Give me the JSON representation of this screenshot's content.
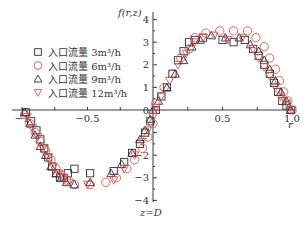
{
  "chart_data": {
    "type": "scatter",
    "title": "",
    "xlabel": "r",
    "ylabel": "f(r,z)",
    "annotation": "z=D",
    "xlim": [
      -1.0,
      1.0
    ],
    "ylim": [
      -4,
      4
    ],
    "x_ticks": [
      -1,
      -0.5,
      0,
      0.5,
      1.0
    ],
    "x_tick_labels": [
      "-1",
      "-0.5",
      "0",
      "0.5",
      "1.0"
    ],
    "y_ticks": [
      4,
      3,
      2,
      1,
      0,
      -2,
      -3,
      -4
    ],
    "y_tick_labels": [
      "4",
      "3",
      "2",
      "1",
      "0",
      "-2",
      "-3",
      "-4"
    ],
    "grid": false,
    "legend_position": "upper-left",
    "series": [
      {
        "name": "入口流量 3m³/h",
        "marker": "square",
        "color": "#2b2f3a",
        "x": [
          -0.97,
          -0.93,
          -0.89,
          -0.86,
          -0.83,
          -0.8,
          -0.77,
          -0.74,
          -0.71,
          -0.68,
          -0.65,
          -0.6,
          -0.48,
          -0.3,
          -0.22,
          -0.16,
          -0.1,
          -0.06,
          -0.02,
          0.02,
          0.06,
          0.1,
          0.14,
          0.18,
          0.22,
          0.26,
          0.3,
          0.36,
          0.5,
          0.58,
          0.66,
          0.72,
          0.76,
          0.8,
          0.84,
          0.87,
          0.9,
          0.93,
          0.96,
          0.99
        ],
        "y": [
          -0.1,
          -0.5,
          -0.9,
          -1.3,
          -1.7,
          -2.1,
          -2.5,
          -2.8,
          -3.0,
          -3.0,
          -2.8,
          -2.6,
          -2.8,
          -2.7,
          -2.3,
          -1.9,
          -1.5,
          -1.0,
          -0.5,
          0.0,
          0.6,
          1.0,
          1.6,
          2.2,
          2.6,
          3.0,
          3.1,
          3.2,
          3.1,
          3.0,
          3.1,
          2.7,
          2.4,
          2.0,
          1.6,
          1.2,
          0.8,
          0.4,
          0.2,
          0.0
        ]
      },
      {
        "name": "入口流量 6m³/h",
        "marker": "circle",
        "color": "#d9534f",
        "x": [
          -0.98,
          -0.94,
          -0.9,
          -0.86,
          -0.82,
          -0.78,
          -0.74,
          -0.7,
          -0.66,
          -0.6,
          -0.48,
          -0.36,
          -0.28,
          -0.2,
          -0.14,
          -0.08,
          -0.04,
          0.0,
          0.02,
          0.08,
          0.14,
          0.2,
          0.26,
          0.3,
          0.38,
          0.48,
          0.58,
          0.68,
          0.74,
          0.8,
          0.84,
          0.88,
          0.91,
          0.94,
          0.97,
          1.0
        ],
        "y": [
          -0.2,
          -0.6,
          -1.0,
          -1.4,
          -1.8,
          -2.2,
          -2.6,
          -2.9,
          -3.1,
          -3.3,
          -3.3,
          -3.2,
          -3.0,
          -2.6,
          -2.2,
          -1.7,
          -1.2,
          -0.6,
          0.3,
          1.0,
          1.6,
          2.3,
          2.7,
          3.2,
          3.4,
          3.5,
          3.5,
          3.5,
          3.2,
          2.8,
          2.3,
          1.8,
          1.3,
          0.8,
          0.4,
          0.0
        ]
      },
      {
        "name": "入口流量 9m³/h",
        "marker": "triangle-up",
        "color": "#2b2f3a",
        "x": [
          -0.98,
          -0.94,
          -0.9,
          -0.86,
          -0.82,
          -0.78,
          -0.74,
          -0.7,
          -0.66,
          -0.6,
          -0.48,
          -0.32,
          -0.24,
          -0.16,
          -0.1,
          -0.06,
          -0.02,
          0.0,
          0.04,
          0.1,
          0.16,
          0.22,
          0.28,
          0.34,
          0.42,
          0.52,
          0.62,
          0.7,
          0.76,
          0.8,
          0.84,
          0.88,
          0.92,
          0.96,
          0.99
        ],
        "y": [
          -0.1,
          -0.6,
          -1.1,
          -1.6,
          -2.0,
          -2.5,
          -2.8,
          -3.0,
          -3.2,
          -3.3,
          -3.2,
          -2.8,
          -2.4,
          -1.9,
          -1.3,
          -0.9,
          -0.4,
          0.0,
          0.4,
          1.0,
          1.6,
          2.2,
          2.8,
          3.1,
          3.3,
          3.2,
          3.2,
          2.9,
          2.6,
          2.2,
          1.8,
          1.3,
          0.8,
          0.4,
          0.0
        ]
      },
      {
        "name": "入口流量 12m³/h",
        "marker": "triangle-down",
        "color": "#d9534f",
        "x": [
          -0.96,
          -0.92,
          -0.88,
          -0.84,
          -0.8,
          -0.76,
          -0.72,
          -0.68,
          -0.64,
          -0.5,
          -0.3,
          -0.22,
          -0.14,
          -0.08,
          -0.04,
          0.0,
          0.02,
          0.06,
          0.12,
          0.18,
          0.24,
          0.3,
          0.36,
          0.44,
          0.54,
          0.64,
          0.72,
          0.76,
          0.8,
          0.84,
          0.88,
          0.92,
          0.96,
          1.0
        ],
        "y": [
          -0.3,
          -0.8,
          -1.2,
          -1.7,
          -2.1,
          -2.5,
          -2.8,
          -3.0,
          -3.2,
          -3.3,
          -3.1,
          -2.6,
          -2.0,
          -1.4,
          -0.9,
          -0.3,
          0.1,
          0.6,
          1.3,
          2.0,
          2.5,
          3.0,
          3.2,
          3.3,
          3.1,
          3.2,
          2.7,
          2.3,
          1.9,
          1.5,
          1.0,
          0.6,
          0.3,
          0.0
        ]
      }
    ]
  },
  "legend": {
    "items": [
      {
        "label": "入口流量 3m³/h",
        "marker": "square",
        "color": "#2b2f3a"
      },
      {
        "label": "入口流量 6m³/h",
        "marker": "circle",
        "color": "#d9534f"
      },
      {
        "label": "入口流量 9m³/h",
        "marker": "triangle-up",
        "color": "#2b2f3a"
      },
      {
        "label": "入口流量 12m³/h",
        "marker": "triangle-down",
        "color": "#d9534f"
      }
    ]
  },
  "axes": {
    "ylabel": "f(r,z)",
    "xlabel": "r",
    "annotation": "z=D"
  }
}
